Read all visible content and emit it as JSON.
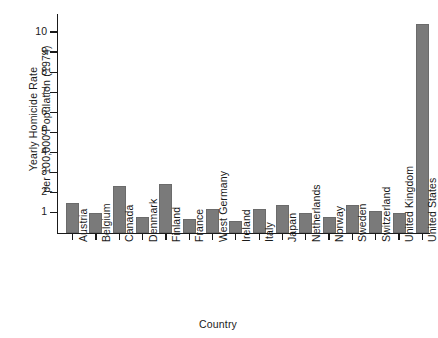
{
  "chart_data": {
    "type": "bar",
    "title": "",
    "xlabel": "Country",
    "ylabel": "Yearly Homicide Rate per 100,000 Population (1974)",
    "ylabel_line1": "Yearly Homicide Rate",
    "ylabel_line2": "per 100,000 Population (1974)",
    "categories": [
      "Austria",
      "Belgium",
      "Canada",
      "Denmark",
      "Finland",
      "France",
      "West Germany",
      "Ireland",
      "Italy",
      "Japan",
      "Netherlands",
      "Norway",
      "Sweden",
      "Switzerland",
      "United Kingdom",
      "United States"
    ],
    "values": [
      1.5,
      1.0,
      2.3,
      0.8,
      2.4,
      0.7,
      1.2,
      0.6,
      1.2,
      1.4,
      1.0,
      0.8,
      1.4,
      1.1,
      1.0,
      10.4
    ],
    "ylim": [
      0,
      10.9
    ],
    "yticks": [
      1,
      2,
      3,
      4,
      5,
      6,
      7,
      8,
      9,
      10
    ],
    "ytick_labels": [
      "1",
      "2",
      "3",
      "4",
      "5",
      "6",
      "7",
      "8",
      "9",
      "10"
    ],
    "grid": false,
    "legend": false,
    "bar_color": "#7a7a7a",
    "axis_color": "#1a1a1a"
  }
}
